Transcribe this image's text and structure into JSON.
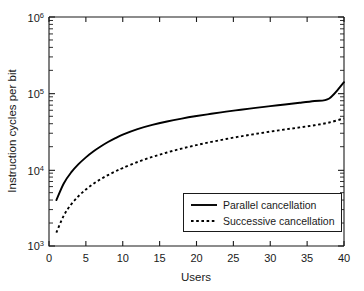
{
  "chart_data": {
    "type": "line",
    "title": "",
    "xlabel": "Users",
    "ylabel": "Instruction cycles per bit",
    "xlim": [
      0,
      40
    ],
    "ylim": [
      1000,
      1000000
    ],
    "yscale": "log",
    "xscale": "linear",
    "grid": false,
    "legend_position": "lower right",
    "xticks": [
      0,
      5,
      10,
      15,
      20,
      25,
      30,
      35,
      40
    ],
    "xtick_labels": [
      "0",
      "5",
      "10",
      "15",
      "20",
      "25",
      "30",
      "35",
      "40"
    ],
    "yticks": [
      1000,
      10000,
      100000,
      1000000
    ],
    "ytick_labels": [
      "10³",
      "10⁴",
      "10⁵",
      "10⁶"
    ],
    "ytick_bases": [
      "10",
      "10",
      "10",
      "10"
    ],
    "ytick_exponents": [
      "3",
      "4",
      "5",
      "6"
    ],
    "series": [
      {
        "name": "Parallel cancellation",
        "style": "solid",
        "color": "#000000",
        "x": [
          1,
          2,
          3,
          4,
          5,
          6,
          7,
          8,
          9,
          10,
          12,
          14,
          16,
          18,
          20,
          22,
          24,
          26,
          28,
          30,
          32,
          34,
          36,
          38,
          40
        ],
        "y": [
          4000,
          6600,
          9200,
          11800,
          14500,
          17300,
          20100,
          23000,
          25900,
          28800,
          34000,
          38600,
          42800,
          46700,
          50400,
          54000,
          57500,
          61000,
          64500,
          68000,
          71500,
          75200,
          79500,
          85500,
          140000
        ]
      },
      {
        "name": "Successive cancellation",
        "style": "dashed",
        "color": "#000000",
        "x": [
          1,
          2,
          3,
          4,
          5,
          6,
          7,
          8,
          9,
          10,
          12,
          14,
          16,
          18,
          20,
          22,
          24,
          26,
          28,
          30,
          32,
          34,
          36,
          38,
          40
        ],
        "y": [
          1500,
          2500,
          3500,
          4500,
          5500,
          6500,
          7500,
          8500,
          9500,
          10500,
          12600,
          14700,
          16800,
          18900,
          21000,
          23100,
          25200,
          27300,
          29400,
          31500,
          33600,
          35800,
          38200,
          41500,
          47000
        ]
      }
    ]
  },
  "legend": {
    "entries": [
      {
        "label": "Parallel cancellation",
        "style": "solid"
      },
      {
        "label": "Successive cancellation",
        "style": "dashed"
      }
    ]
  },
  "axes": {
    "x_title": "Users",
    "y_title": "Instruction cycles per bit"
  },
  "colors": {
    "background": "#ffffff",
    "foreground": "#1a1a1a",
    "line": "#000000"
  }
}
